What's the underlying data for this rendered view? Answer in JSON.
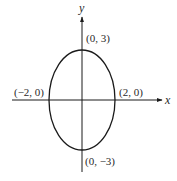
{
  "figure": {
    "equation_hint": "x^2/4 + y^2/9 = 1",
    "colors": {
      "stroke": "#1a1a1a",
      "background": "#ffffff",
      "text": "#2a2a2a"
    }
  },
  "axes": {
    "x_label": "x",
    "y_label": "y"
  },
  "points": [
    {
      "name": "top-vertex",
      "label": "(0, 3)",
      "x": 0,
      "y": 3
    },
    {
      "name": "bottom-vertex",
      "label": "(0, −3)",
      "x": 0,
      "y": -3
    },
    {
      "name": "left-vertex",
      "label": "(−2, 0)",
      "x": -2,
      "y": 0
    },
    {
      "name": "right-vertex",
      "label": "(2, 0)",
      "x": 2,
      "y": 0
    }
  ],
  "ellipse": {
    "center": [
      0,
      0
    ],
    "semi_major_axis": 3,
    "semi_minor_axis": 2,
    "orientation": "vertical"
  }
}
